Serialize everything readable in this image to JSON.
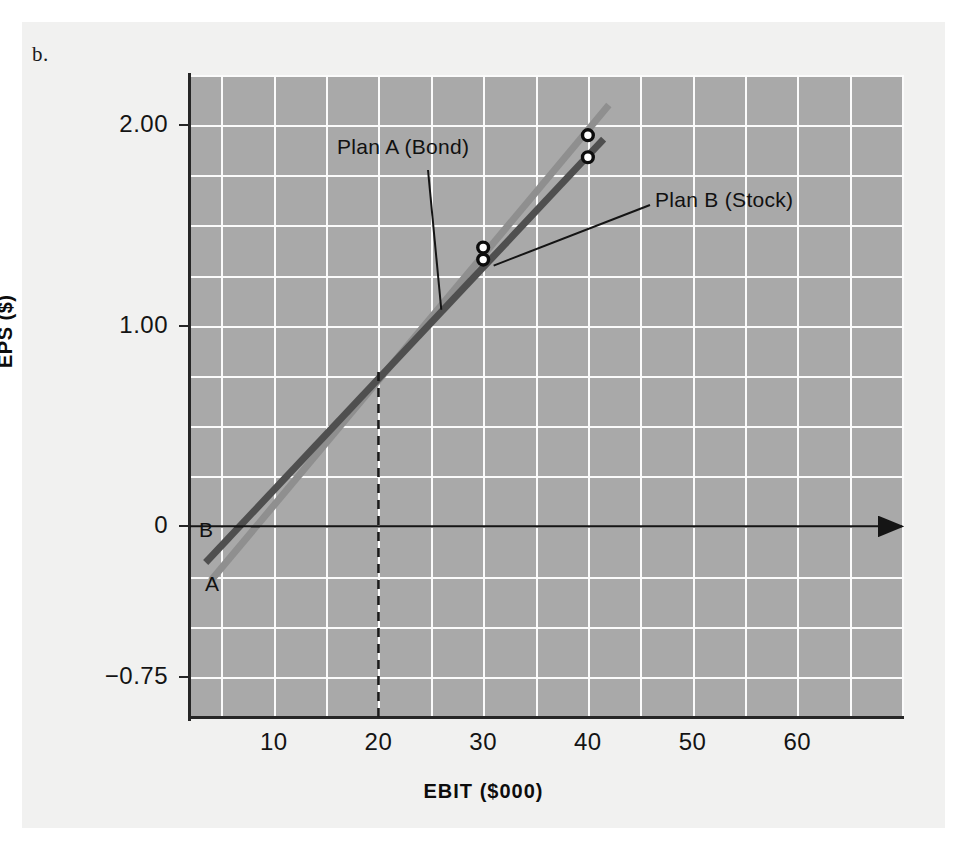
{
  "part_label": "b.",
  "chart_data": {
    "type": "line",
    "title": "",
    "xlabel": "EBIT ($000)",
    "ylabel": "EPS ($)",
    "xlim": [
      2,
      70
    ],
    "ylim": [
      -0.95,
      2.25
    ],
    "xticks": [
      "10",
      "20",
      "30",
      "40",
      "50",
      "60"
    ],
    "xtick_values": [
      10,
      20,
      30,
      40,
      50,
      60
    ],
    "yticks": [
      "2.00",
      "1.00",
      "0",
      "−0.75"
    ],
    "ytick_values": [
      2.0,
      1.0,
      0,
      -0.75
    ],
    "grid": true,
    "grid_x_step": 5,
    "grid_y_step": 0.25,
    "legend_position": "inline-annotations",
    "series": [
      {
        "name": "Plan A (Bond)",
        "short_label": "A",
        "color": "#8f8f8f",
        "x": [
          4.0,
          42.0
        ],
        "y": [
          -0.27,
          2.1
        ],
        "points": [
          {
            "x": 30,
            "y": 1.39
          },
          {
            "x": 40,
            "y": 1.95
          }
        ]
      },
      {
        "name": "Plan B (Stock)",
        "short_label": "B",
        "color": "#4f4f4f",
        "x": [
          3.5,
          41.5
        ],
        "y": [
          -0.18,
          1.93
        ],
        "points": [
          {
            "x": 30,
            "y": 1.33
          },
          {
            "x": 40,
            "y": 1.84
          }
        ]
      }
    ],
    "annotations": [
      {
        "label": "Plan A (Bond)",
        "target_x": 26.0,
        "target_y": 1.08
      },
      {
        "label": "Plan B (Stock)",
        "target_x": 31.0,
        "target_y": 1.3
      }
    ],
    "crossover": {
      "x": 20,
      "y": 0.77,
      "marker": "dashed-vertical-line"
    },
    "zero_axis": {
      "value": 0,
      "style": "solid-with-right-arrow"
    }
  }
}
